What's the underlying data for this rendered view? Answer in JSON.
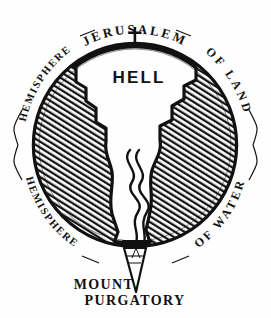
{
  "figure": {
    "background_color": "#fefefe",
    "ink_color": "#111111"
  },
  "labels": {
    "top_center": "JERUSALEM",
    "top_left": "HEMISPHERE",
    "top_right": "OF LAND",
    "bottom_left": "HEMISPHERE",
    "bottom_right": "OF WATER",
    "center": "HELL",
    "bottom_line1": "MOUNT",
    "bottom_line2": "PURGATORY"
  },
  "icons": {
    "summit_cross": "cross-icon",
    "purgatory_cone": "cone-icon"
  },
  "geometry": {
    "circle_center_x": 135,
    "circle_center_y": 145,
    "circle_radius": 104
  }
}
